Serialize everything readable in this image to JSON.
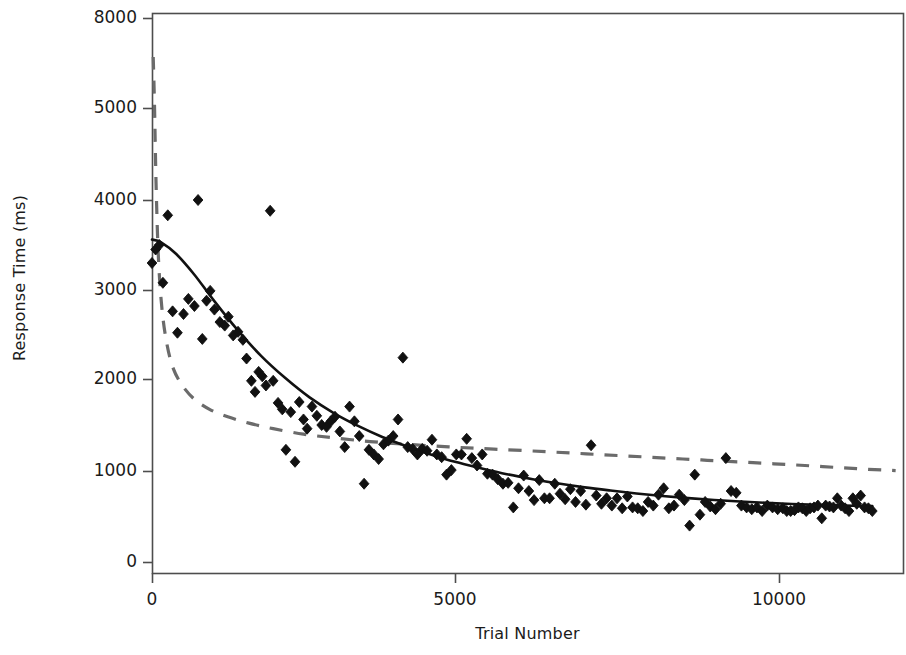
{
  "figure": {
    "title": "",
    "background": "#ffffff",
    "frame_color": "#4d4d4d"
  },
  "axes": {
    "x_title": "Trial Number",
    "y_title": "Response Time (ms)",
    "x_ticks": [
      {
        "value": 0,
        "label": "0",
        "px": 152
      },
      {
        "value": 5000,
        "label": "5000",
        "px": 455
      },
      {
        "value": 10000,
        "label": "10000",
        "px": 779
      }
    ],
    "y_ticks": [
      {
        "value": 8000,
        "label": "8000",
        "px": 18
      },
      {
        "value": 5000,
        "label": "5000",
        "px": 108
      },
      {
        "value": 4000,
        "label": "4000",
        "px": 200
      },
      {
        "value": 3000,
        "label": "3000",
        "px": 290
      },
      {
        "value": 2000,
        "label": "2000",
        "px": 379
      },
      {
        "value": 1000,
        "label": "1000",
        "px": 471
      },
      {
        "value": 0,
        "label": "0",
        "px": 562
      }
    ],
    "plot_area": {
      "left": 152,
      "right": 903,
      "top": 13,
      "bottom": 573
    }
  },
  "chart_data": {
    "type": "scatter",
    "title": "",
    "xlabel": "Trial Number",
    "ylabel": "Response Time (ms)",
    "xlim": [
      -200,
      11900
    ],
    "ylim": [
      0,
      8000
    ],
    "grid": false,
    "legend": "none",
    "marker": {
      "shape": "diamond",
      "color": "#111111",
      "size": 11
    },
    "series": [
      {
        "name": "Observed response times",
        "type": "scatter",
        "points": [
          [
            0,
            3300
          ],
          [
            60,
            3450
          ],
          [
            120,
            3500
          ],
          [
            180,
            3080
          ],
          [
            260,
            3830
          ],
          [
            340,
            2760
          ],
          [
            420,
            2520
          ],
          [
            520,
            2730
          ],
          [
            600,
            2900
          ],
          [
            700,
            2820
          ],
          [
            760,
            4000
          ],
          [
            830,
            2450
          ],
          [
            900,
            2880
          ],
          [
            960,
            2990
          ],
          [
            1030,
            2780
          ],
          [
            1120,
            2640
          ],
          [
            1200,
            2600
          ],
          [
            1260,
            2700
          ],
          [
            1340,
            2490
          ],
          [
            1420,
            2530
          ],
          [
            1500,
            2440
          ],
          [
            1560,
            2230
          ],
          [
            1640,
            1980
          ],
          [
            1700,
            1860
          ],
          [
            1760,
            2080
          ],
          [
            1820,
            2030
          ],
          [
            1880,
            1930
          ],
          [
            1950,
            3880
          ],
          [
            2000,
            1980
          ],
          [
            2080,
            1740
          ],
          [
            2150,
            1670
          ],
          [
            2210,
            1230
          ],
          [
            2290,
            1640
          ],
          [
            2360,
            1100
          ],
          [
            2430,
            1750
          ],
          [
            2500,
            1560
          ],
          [
            2560,
            1460
          ],
          [
            2640,
            1700
          ],
          [
            2720,
            1600
          ],
          [
            2800,
            1500
          ],
          [
            2880,
            1480
          ],
          [
            2950,
            1540
          ],
          [
            3020,
            1590
          ],
          [
            3100,
            1430
          ],
          [
            3180,
            1260
          ],
          [
            3260,
            1700
          ],
          [
            3340,
            1540
          ],
          [
            3420,
            1380
          ],
          [
            3500,
            860
          ],
          [
            3580,
            1230
          ],
          [
            3660,
            1180
          ],
          [
            3740,
            1130
          ],
          [
            3820,
            1290
          ],
          [
            3900,
            1330
          ],
          [
            3980,
            1380
          ],
          [
            4060,
            1560
          ],
          [
            4140,
            2240
          ],
          [
            4220,
            1260
          ],
          [
            4300,
            1240
          ],
          [
            4380,
            1180
          ],
          [
            4460,
            1240
          ],
          [
            4540,
            1220
          ],
          [
            4620,
            1340
          ],
          [
            4700,
            1180
          ],
          [
            4780,
            1150
          ],
          [
            4860,
            960
          ],
          [
            4940,
            1010
          ],
          [
            5020,
            1180
          ],
          [
            5100,
            1180
          ],
          [
            5180,
            1350
          ],
          [
            5260,
            1140
          ],
          [
            5340,
            1060
          ],
          [
            5420,
            1180
          ],
          [
            5500,
            970
          ],
          [
            5580,
            960
          ],
          [
            5660,
            910
          ],
          [
            5740,
            860
          ],
          [
            5820,
            870
          ],
          [
            5900,
            600
          ],
          [
            5980,
            810
          ],
          [
            6060,
            950
          ],
          [
            6140,
            780
          ],
          [
            6220,
            680
          ],
          [
            6300,
            900
          ],
          [
            6380,
            700
          ],
          [
            6460,
            700
          ],
          [
            6540,
            860
          ],
          [
            6620,
            750
          ],
          [
            6700,
            690
          ],
          [
            6780,
            800
          ],
          [
            6860,
            660
          ],
          [
            6940,
            780
          ],
          [
            7020,
            630
          ],
          [
            7100,
            1280
          ],
          [
            7180,
            730
          ],
          [
            7260,
            640
          ],
          [
            7340,
            700
          ],
          [
            7420,
            620
          ],
          [
            7500,
            700
          ],
          [
            7580,
            590
          ],
          [
            7660,
            720
          ],
          [
            7740,
            600
          ],
          [
            7820,
            590
          ],
          [
            7900,
            560
          ],
          [
            7980,
            660
          ],
          [
            8060,
            620
          ],
          [
            8140,
            740
          ],
          [
            8220,
            810
          ],
          [
            8300,
            590
          ],
          [
            8380,
            620
          ],
          [
            8460,
            740
          ],
          [
            8540,
            680
          ],
          [
            8620,
            400
          ],
          [
            8700,
            960
          ],
          [
            8780,
            520
          ],
          [
            8860,
            660
          ],
          [
            8940,
            610
          ],
          [
            9020,
            580
          ],
          [
            9100,
            640
          ],
          [
            9180,
            1140
          ],
          [
            9260,
            780
          ],
          [
            9340,
            760
          ],
          [
            9420,
            620
          ],
          [
            9500,
            600
          ],
          [
            9580,
            580
          ],
          [
            9660,
            600
          ],
          [
            9740,
            560
          ],
          [
            9820,
            620
          ],
          [
            9900,
            600
          ],
          [
            9980,
            580
          ],
          [
            10060,
            590
          ],
          [
            10120,
            560
          ],
          [
            10180,
            560
          ],
          [
            10240,
            570
          ],
          [
            10300,
            600
          ],
          [
            10360,
            590
          ],
          [
            10420,
            560
          ],
          [
            10480,
            590
          ],
          [
            10540,
            600
          ],
          [
            10600,
            620
          ],
          [
            10660,
            480
          ],
          [
            10720,
            620
          ],
          [
            10780,
            610
          ],
          [
            10840,
            600
          ],
          [
            10900,
            700
          ],
          [
            10960,
            620
          ],
          [
            11020,
            590
          ],
          [
            11080,
            560
          ],
          [
            11140,
            700
          ],
          [
            11200,
            640
          ],
          [
            11260,
            730
          ],
          [
            11320,
            600
          ],
          [
            11380,
            590
          ],
          [
            11440,
            560
          ]
        ]
      },
      {
        "name": "Power-law fit (solid)",
        "type": "line",
        "style": "solid",
        "color": "#111111",
        "width": 2.6,
        "points": [
          [
            0,
            3560
          ],
          [
            150,
            3530
          ],
          [
            400,
            3400
          ],
          [
            700,
            3170
          ],
          [
            1000,
            2900
          ],
          [
            1400,
            2560
          ],
          [
            1800,
            2260
          ],
          [
            2200,
            2010
          ],
          [
            2600,
            1800
          ],
          [
            3000,
            1630
          ],
          [
            3400,
            1490
          ],
          [
            3800,
            1370
          ],
          [
            4200,
            1270
          ],
          [
            4600,
            1180
          ],
          [
            5000,
            1100
          ],
          [
            5400,
            1030
          ],
          [
            5800,
            965
          ],
          [
            6200,
            910
          ],
          [
            6600,
            862
          ],
          [
            7000,
            820
          ],
          [
            7400,
            785
          ],
          [
            7800,
            753
          ],
          [
            8200,
            726
          ],
          [
            8600,
            702
          ],
          [
            9000,
            682
          ],
          [
            9400,
            665
          ],
          [
            9800,
            650
          ],
          [
            10200,
            638
          ],
          [
            10600,
            628
          ],
          [
            11000,
            620
          ],
          [
            11440,
            614
          ]
        ]
      },
      {
        "name": "Exponential / alternative fit (dashed)",
        "type": "line",
        "style": "dashed",
        "color": "#6b6b6b",
        "width": 3.2,
        "points": [
          [
            20,
            6700
          ],
          [
            40,
            5200
          ],
          [
            70,
            4100
          ],
          [
            110,
            3300
          ],
          [
            170,
            2750
          ],
          [
            250,
            2380
          ],
          [
            350,
            2120
          ],
          [
            500,
            1930
          ],
          [
            700,
            1780
          ],
          [
            950,
            1670
          ],
          [
            1250,
            1590
          ],
          [
            1600,
            1520
          ],
          [
            2000,
            1460
          ],
          [
            2500,
            1400
          ],
          [
            3000,
            1360
          ],
          [
            3600,
            1320
          ],
          [
            4200,
            1290
          ],
          [
            4900,
            1262
          ],
          [
            5600,
            1238
          ],
          [
            6400,
            1210
          ],
          [
            7200,
            1180
          ],
          [
            8000,
            1150
          ],
          [
            8800,
            1120
          ],
          [
            9600,
            1090
          ],
          [
            10400,
            1060
          ],
          [
            11200,
            1025
          ],
          [
            11800,
            1005
          ]
        ]
      }
    ]
  }
}
